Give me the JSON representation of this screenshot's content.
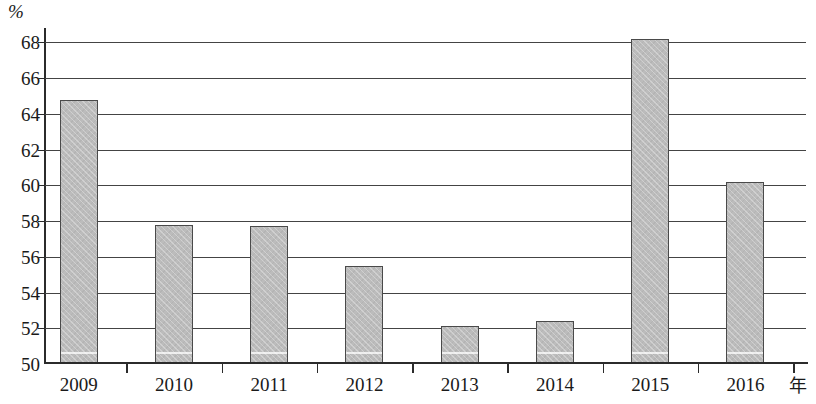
{
  "chart_data": {
    "type": "bar",
    "title": "",
    "subtitle": "",
    "xlabel": "年",
    "ylabel": "%",
    "categories": [
      "2009",
      "2010",
      "2011",
      "2012",
      "2013",
      "2014",
      "2015",
      "2016"
    ],
    "values": [
      64.8,
      57.8,
      57.7,
      55.5,
      52.1,
      52.4,
      68.2,
      60.2
    ],
    "series": [
      {
        "name": "",
        "values": [
          64.8,
          57.8,
          57.7,
          55.5,
          52.1,
          52.4,
          68.2,
          60.2
        ]
      }
    ],
    "ylim": [
      50,
      68.8
    ],
    "y_axis_min": 50,
    "y_axis_max": 68.8,
    "y_tick_labels": [
      "68",
      "66",
      "64",
      "62",
      "60",
      "58",
      "56",
      "54",
      "52",
      "50"
    ],
    "y_tick_values": [
      68,
      66,
      64,
      62,
      60,
      58,
      56,
      54,
      52,
      50
    ],
    "y_tick_step": 2,
    "grid": true,
    "grid_orientation": "horizontal",
    "legend": false,
    "legend_position": "none",
    "bar_color": "#bcbcbc",
    "bar_border_color": "#4a4a4a",
    "axis_color": "#2b2b2b",
    "gridline_color": "#444444",
    "background_color": "#ffffff"
  }
}
